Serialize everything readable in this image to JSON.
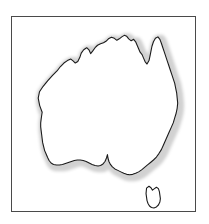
{
  "figure": {
    "title": "Australia",
    "caption": "",
    "type": "outline-map",
    "region": "Australia",
    "background_color": "#ffffff",
    "frame": {
      "visible": true,
      "border_color": "#4a4a4a",
      "border_width_px": 1,
      "x": 11,
      "y": 16,
      "width": 185,
      "height": 196
    },
    "styles": {
      "coastline_color": "#1a1a1a",
      "coastline_width_px": 1.1,
      "landmass_fill": "#ffffff",
      "halo_color": "#c9c9c9",
      "halo_opacity": 0.85,
      "halo_width_px": 5
    },
    "landmasses": [
      {
        "name": "mainland-australia",
        "label": "Australian mainland",
        "has_halo": true,
        "outline_path": "M 30.5 96.2 L 28.0 89.5 L 26.5 82.0 L 27.8 75.5 L 31.5 70.0 L 36.0 64.5 L 41.0 59.0 L 45.5 54.5 L 49.0 50.0 L 52.5 46.5 L 56.0 44.0 L 59.5 42.5 L 62.0 44.5 L 64.0 46.5 L 66.5 45.0 L 68.5 41.0 L 70.0 36.5 L 72.5 33.0 L 75.5 31.0 L 78.0 33.5 L 79.5 37.0 L 81.5 34.5 L 84.0 31.0 L 86.5 28.5 L 89.5 27.0 L 92.5 26.0 L 95.0 24.5 L 97.5 22.0 L 100.5 20.5 L 103.5 21.5 L 106.0 23.5 L 108.5 22.0 L 111.0 20.0 L 113.5 18.5 L 116.0 19.5 L 118.0 22.0 L 120.5 24.0 L 123.0 22.5 L 125.0 25.0 L 126.5 28.5 L 128.0 32.0 L 129.5 35.5 L 131.5 38.0 L 133.0 41.5 L 134.5 45.0 L 136.5 47.5 L 138.5 44.0 L 139.5 39.5 L 140.5 34.5 L 141.5 29.5 L 143.0 25.0 L 145.0 21.5 L 147.5 20.0 L 149.5 22.5 L 151.0 26.5 L 152.5 31.0 L 154.0 35.5 L 155.5 40.0 L 157.0 44.5 L 158.5 49.0 L 160.0 53.5 L 161.5 58.0 L 163.0 62.5 L 164.5 67.0 L 165.5 72.0 L 166.5 77.0 L 167.0 82.0 L 167.5 87.0 L 167.0 92.0 L 166.0 97.0 L 164.5 102.0 L 163.0 107.0 L 161.0 111.5 L 159.0 116.0 L 157.0 120.5 L 155.0 125.0 L 153.0 129.5 L 151.0 134.0 L 148.5 138.0 L 146.0 141.5 L 143.0 144.5 L 140.0 147.0 L 137.0 149.5 L 134.0 152.0 L 131.0 154.5 L 128.0 156.5 L 125.0 158.0 L 122.0 159.0 L 119.0 159.5 L 116.0 159.0 L 113.0 158.0 L 110.0 156.5 L 107.0 155.0 L 104.0 153.5 L 101.5 151.5 L 99.5 149.0 L 98.0 146.0 L 97.0 142.5 L 96.5 139.0 L 95.5 142.5 L 94.0 146.0 L 92.0 148.5 L 89.5 150.0 L 87.0 150.5 L 84.0 150.0 L 81.0 149.0 L 78.0 147.5 L 75.0 146.0 L 72.0 145.0 L 69.0 144.5 L 66.0 144.5 L 63.0 145.0 L 60.0 146.0 L 57.0 147.0 L 54.0 148.0 L 51.0 149.0 L 48.0 149.5 L 45.0 149.5 L 42.0 149.0 L 39.5 147.5 L 37.5 145.0 L 36.0 142.0 L 34.5 138.5 L 33.0 135.0 L 32.0 131.0 L 31.0 127.0 L 30.5 123.0 L 30.0 119.0 L 29.5 115.0 L 29.0 111.0 L 29.0 107.0 L 29.5 103.0 L 30.0 99.5 Z"
      },
      {
        "name": "tasmania",
        "label": "Tasmania",
        "has_halo": false,
        "outline_path": "M 136.0 173.0 L 138.5 171.0 L 140.5 172.5 L 142.0 175.0 L 144.0 173.5 L 146.0 172.0 L 148.0 173.5 L 149.0 176.5 L 149.5 180.0 L 150.0 183.5 L 149.5 187.0 L 148.0 190.0 L 146.0 192.0 L 143.5 193.0 L 141.0 192.5 L 139.0 191.0 L 137.5 188.5 L 136.5 185.5 L 136.0 182.0 L 135.5 178.5 Z"
      }
    ],
    "features": [
      {
        "name": "cape-york-peninsula",
        "label": "Cape York Peninsula"
      },
      {
        "name": "gulf-of-carpentaria",
        "label": "Gulf of Carpentaria"
      },
      {
        "name": "great-australian-bight",
        "label": "Great Australian Bight"
      },
      {
        "name": "bass-strait",
        "label": "Bass Strait"
      }
    ]
  }
}
